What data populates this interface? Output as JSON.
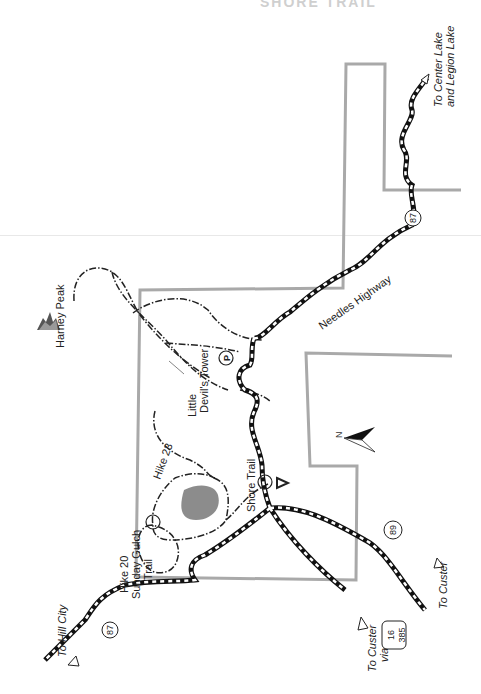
{
  "map": {
    "title_fragment": "SHORE TRAIL",
    "colors": {
      "boundary": "#a9a9a9",
      "road_dark": "#111111",
      "road_light": "#ffffff",
      "trail": "#222222",
      "lake": "#8c8c8c",
      "paper": "#ffffff"
    },
    "labels": {
      "harney_peak": "Harney Peak",
      "little_devils_tower_1": "Little",
      "little_devils_tower_2": "Devil's Tower",
      "needles_highway": "Needles Highway",
      "hike23": "Hike 23",
      "shore_trail": "Shore Trail",
      "hike20_1": "Hike 20",
      "hike20_2": "Sunday Gulch",
      "hike20_3": "Trail",
      "to_hill_city": "To Hill City",
      "to_custer_via_1": "To Custer",
      "to_custer_via_2": "via",
      "to_custer": "To Custer",
      "to_center_lake_1": "To Center Lake",
      "to_center_lake_2": "and Legion Lake",
      "north": "N",
      "parking": "P"
    },
    "route_shields": {
      "hwy87_top": "87",
      "hwy87_bottom": "87",
      "hwy89": "89",
      "us16": "16",
      "us385": "385"
    },
    "icons": [
      "mountain-peak-icon",
      "parking-icon",
      "campground-icon",
      "north-arrow-icon",
      "trailhead-icon"
    ]
  }
}
